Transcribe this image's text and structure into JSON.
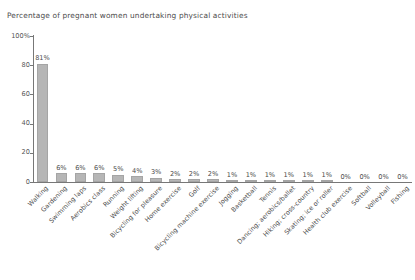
{
  "chart_data": {
    "type": "bar",
    "title": "Percentage of pregnant women undertaking physical activities",
    "xlabel": "",
    "ylabel": "",
    "ylim": [
      0,
      100
    ],
    "yticks": [
      "0",
      "20",
      "40",
      "60",
      "80",
      "100%"
    ],
    "ytick_values": [
      0,
      20,
      40,
      60,
      80,
      100
    ],
    "grid": false,
    "legend": "none",
    "bar_color": "#b6b6b6",
    "categories": [
      "Walking",
      "Gardening",
      "Swimming laps",
      "Aerobics class",
      "Running",
      "Weight lifting",
      "Bicycling for pleasure",
      "Home exercise",
      "Golf",
      "Bicycling machine exercise",
      "Jogging",
      "Basketball",
      "Tennis",
      "Dancing; aerobics/ballet",
      "Hiking; cross-country",
      "Skating; ice or roller",
      "Health club exercise",
      "Softball",
      "Volleyball",
      "Fishing"
    ],
    "values": [
      81,
      6,
      6,
      6,
      5,
      4,
      3,
      2,
      2,
      2,
      1,
      1,
      1,
      1,
      1,
      1,
      0,
      0,
      0,
      0
    ],
    "value_labels": [
      "81%",
      "6%",
      "6%",
      "6%",
      "5%",
      "4%",
      "3%",
      "2%",
      "2%",
      "2%",
      "1%",
      "1%",
      "1%",
      "1%",
      "1%",
      "1%",
      "0%",
      "0%",
      "0%",
      "0%"
    ]
  }
}
